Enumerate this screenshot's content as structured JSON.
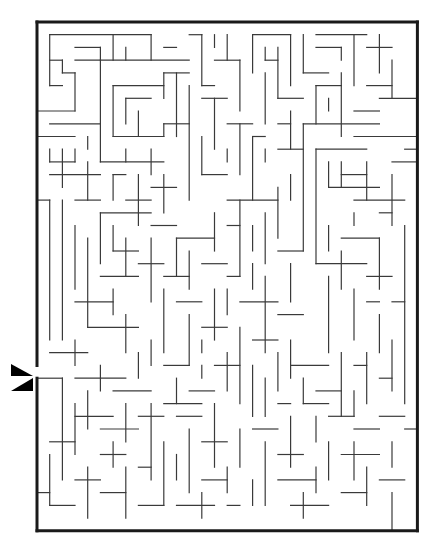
{
  "puzzle": {
    "type": "maze",
    "title": "",
    "grid": {
      "origin_x": 37,
      "origin_y": 22,
      "cols": 30,
      "rows": 40,
      "cell_w": 12.68,
      "cell_h": 12.72
    },
    "colors": {
      "wall": "#3a3a3a",
      "border": "#1a1a1a",
      "background": "#ffffff",
      "marker": "#000000"
    },
    "entrance": {
      "side": "left",
      "row": 27,
      "markers": [
        {
          "name": "arrow-in-icon",
          "direction": "right",
          "points": "11,364 33,376 11,376"
        },
        {
          "name": "arrow-out-icon",
          "direction": "left",
          "points": "33,378 33,391 11,391"
        }
      ]
    },
    "border_segments": [
      [
        0,
        0,
        30,
        0
      ],
      [
        30,
        0,
        30,
        40
      ],
      [
        0,
        40,
        30,
        40
      ],
      [
        0,
        0,
        0,
        27
      ],
      [
        0,
        28,
        0,
        40
      ]
    ],
    "walls": [
      [
        1,
        1,
        9,
        1
      ],
      [
        1,
        1,
        1,
        5
      ],
      [
        3,
        2,
        5,
        2
      ],
      [
        5,
        2,
        5,
        3
      ],
      [
        3,
        3,
        12,
        3
      ],
      [
        6,
        1,
        6,
        3
      ],
      [
        7,
        2,
        7,
        3
      ],
      [
        9,
        1,
        9,
        3
      ],
      [
        10,
        2,
        11,
        2
      ],
      [
        1,
        3,
        2,
        3
      ],
      [
        2,
        3,
        2,
        4
      ],
      [
        2,
        4,
        3,
        4
      ],
      [
        3,
        4,
        3,
        7
      ],
      [
        1,
        5,
        2,
        5
      ],
      [
        0,
        7,
        3,
        7
      ],
      [
        5,
        3,
        5,
        11
      ],
      [
        6,
        5,
        10,
        5
      ],
      [
        6,
        5,
        6,
        9
      ],
      [
        6,
        9,
        10,
        9
      ],
      [
        7,
        6,
        9,
        6
      ],
      [
        7,
        6,
        7,
        8
      ],
      [
        8,
        7,
        8,
        9
      ],
      [
        10,
        4,
        12,
        4
      ],
      [
        10,
        4,
        10,
        6
      ],
      [
        10,
        8,
        12,
        8
      ],
      [
        10,
        8,
        10,
        9
      ],
      [
        1,
        8,
        5,
        8
      ],
      [
        0,
        9,
        3,
        9
      ],
      [
        1,
        10,
        1,
        11
      ],
      [
        1,
        11,
        3,
        11
      ],
      [
        3,
        10,
        3,
        11
      ],
      [
        4,
        9,
        4,
        10
      ],
      [
        2,
        10,
        2,
        13
      ],
      [
        1,
        12,
        5,
        12
      ],
      [
        4,
        11,
        4,
        14
      ],
      [
        5,
        11,
        10,
        11
      ],
      [
        7,
        10,
        7,
        11
      ],
      [
        9,
        10,
        9,
        12
      ],
      [
        3,
        14,
        5,
        14
      ],
      [
        1,
        14,
        1,
        25
      ],
      [
        2,
        14,
        2,
        25
      ],
      [
        0,
        14,
        1,
        14
      ],
      [
        6,
        12,
        6,
        14
      ],
      [
        6,
        12,
        7,
        12
      ],
      [
        7,
        14,
        9,
        14
      ],
      [
        8,
        12,
        8,
        16
      ],
      [
        9,
        16,
        11,
        16
      ],
      [
        9,
        13,
        11,
        13
      ],
      [
        10,
        12,
        10,
        15
      ],
      [
        12,
        1,
        13,
        1
      ],
      [
        13,
        1,
        13,
        5
      ],
      [
        14,
        1,
        14,
        2
      ],
      [
        15,
        1,
        15,
        3
      ],
      [
        13,
        5,
        14,
        5
      ],
      [
        14,
        3,
        16,
        3
      ],
      [
        16,
        3,
        16,
        7
      ],
      [
        17,
        1,
        20,
        1
      ],
      [
        17,
        1,
        17,
        4
      ],
      [
        18,
        2,
        18,
        3
      ],
      [
        18,
        3,
        19,
        3
      ],
      [
        19,
        2,
        19,
        6
      ],
      [
        20,
        1,
        20,
        5
      ],
      [
        19,
        6,
        21,
        6
      ],
      [
        12,
        5,
        12,
        14
      ],
      [
        11,
        4,
        11,
        9
      ],
      [
        13,
        6,
        15,
        6
      ],
      [
        14,
        6,
        14,
        10
      ],
      [
        15,
        8,
        17,
        8
      ],
      [
        16,
        8,
        16,
        12
      ],
      [
        13,
        9,
        13,
        12
      ],
      [
        13,
        12,
        15,
        12
      ],
      [
        15,
        10,
        15,
        11
      ],
      [
        17,
        9,
        18,
        9
      ],
      [
        17,
        9,
        17,
        14
      ],
      [
        18,
        10,
        18,
        11
      ],
      [
        21,
        1,
        21,
        4
      ],
      [
        21,
        4,
        23,
        4
      ],
      [
        22,
        1,
        26,
        1
      ],
      [
        22,
        2,
        24,
        2
      ],
      [
        24,
        2,
        24,
        3
      ],
      [
        25,
        1,
        25,
        5
      ],
      [
        26,
        2,
        28,
        2
      ],
      [
        27,
        1,
        27,
        4
      ],
      [
        28,
        3,
        28,
        6
      ],
      [
        26,
        5,
        28,
        5
      ],
      [
        24,
        4,
        24,
        9
      ],
      [
        22,
        5,
        24,
        5
      ],
      [
        22,
        5,
        22,
        8
      ],
      [
        23,
        6,
        23,
        7
      ],
      [
        21,
        8,
        27,
        8
      ],
      [
        27,
        6,
        30,
        6
      ],
      [
        25,
        7,
        27,
        7
      ],
      [
        25,
        9,
        30,
        9
      ],
      [
        21,
        8,
        21,
        18
      ],
      [
        18,
        4,
        18,
        8
      ],
      [
        19,
        8,
        20,
        8
      ],
      [
        20,
        7,
        20,
        10
      ],
      [
        19,
        10,
        21,
        10
      ],
      [
        22,
        10,
        26,
        10
      ],
      [
        22,
        10,
        22,
        19
      ],
      [
        23,
        11,
        23,
        13
      ],
      [
        23,
        13,
        27,
        13
      ],
      [
        24,
        12,
        26,
        12
      ],
      [
        24,
        11,
        24,
        13
      ],
      [
        25,
        14,
        29,
        14
      ],
      [
        26,
        11,
        26,
        14
      ],
      [
        28,
        12,
        28,
        16
      ],
      [
        27,
        15,
        28,
        15
      ],
      [
        29,
        10,
        30,
        10
      ],
      [
        28,
        11,
        30,
        11
      ],
      [
        22,
        19,
        26,
        19
      ],
      [
        23,
        16,
        23,
        18
      ],
      [
        24,
        17,
        27,
        17
      ],
      [
        25,
        15,
        25,
        16
      ],
      [
        27,
        17,
        27,
        21
      ],
      [
        24,
        18,
        24,
        21
      ],
      [
        26,
        20,
        28,
        20
      ],
      [
        29,
        16,
        29,
        30
      ],
      [
        28,
        22,
        29,
        22
      ],
      [
        25,
        21,
        25,
        25
      ],
      [
        23,
        20,
        23,
        26
      ],
      [
        11,
        17,
        14,
        17
      ],
      [
        11,
        17,
        11,
        20
      ],
      [
        12,
        18,
        12,
        21
      ],
      [
        13,
        19,
        15,
        19
      ],
      [
        14,
        15,
        14,
        18
      ],
      [
        15,
        16,
        16,
        16
      ],
      [
        16,
        14,
        16,
        20
      ],
      [
        15,
        14,
        19,
        14
      ],
      [
        18,
        15,
        18,
        19
      ],
      [
        19,
        13,
        19,
        17
      ],
      [
        20,
        12,
        20,
        14
      ],
      [
        17,
        16,
        17,
        18
      ],
      [
        5,
        15,
        9,
        15
      ],
      [
        5,
        15,
        5,
        19
      ],
      [
        6,
        16,
        6,
        18
      ],
      [
        6,
        18,
        8,
        18
      ],
      [
        7,
        17,
        7,
        20
      ],
      [
        8,
        19,
        10,
        19
      ],
      [
        9,
        17,
        9,
        22
      ],
      [
        3,
        16,
        3,
        21
      ],
      [
        4,
        17,
        4,
        24
      ],
      [
        3,
        22,
        6,
        22
      ],
      [
        5,
        20,
        8,
        20
      ],
      [
        6,
        21,
        6,
        23
      ],
      [
        4,
        24,
        8,
        24
      ],
      [
        7,
        23,
        7,
        26
      ],
      [
        10,
        20,
        12,
        20
      ],
      [
        10,
        21,
        10,
        26
      ],
      [
        11,
        22,
        13,
        22
      ],
      [
        12,
        23,
        12,
        27
      ],
      [
        13,
        24,
        15,
        24
      ],
      [
        14,
        21,
        14,
        25
      ],
      [
        15,
        20,
        16,
        20
      ],
      [
        15,
        21,
        15,
        23
      ],
      [
        16,
        22,
        19,
        22
      ],
      [
        17,
        19,
        17,
        21
      ],
      [
        18,
        20,
        18,
        26
      ],
      [
        19,
        23,
        21,
        23
      ],
      [
        20,
        19,
        20,
        22
      ],
      [
        19,
        18,
        21,
        18
      ],
      [
        16,
        24,
        16,
        30
      ],
      [
        17,
        25,
        19,
        25
      ],
      [
        17,
        27,
        17,
        31
      ],
      [
        19,
        26,
        19,
        29
      ],
      [
        1,
        26,
        4,
        26
      ],
      [
        3,
        25,
        3,
        27
      ],
      [
        0,
        28,
        2,
        28
      ],
      [
        2,
        28,
        2,
        36
      ],
      [
        3,
        28,
        7,
        28
      ],
      [
        5,
        27,
        5,
        29
      ],
      [
        6,
        29,
        9,
        29
      ],
      [
        8,
        26,
        8,
        28
      ],
      [
        9,
        25,
        9,
        27
      ],
      [
        10,
        27,
        12,
        27
      ],
      [
        11,
        28,
        11,
        30
      ],
      [
        12,
        29,
        14,
        29
      ],
      [
        13,
        27,
        13,
        28
      ],
      [
        3,
        30,
        3,
        34
      ],
      [
        4,
        29,
        4,
        32
      ],
      [
        3,
        31,
        6,
        31
      ],
      [
        5,
        32,
        8,
        32
      ],
      [
        7,
        30,
        7,
        33
      ],
      [
        8,
        31,
        10,
        31
      ],
      [
        9,
        30,
        9,
        36
      ],
      [
        1,
        33,
        3,
        33
      ],
      [
        1,
        34,
        1,
        38
      ],
      [
        0,
        37,
        1,
        37
      ],
      [
        1,
        38,
        3,
        38
      ],
      [
        3,
        36,
        5,
        36
      ],
      [
        4,
        35,
        4,
        39
      ],
      [
        5,
        37,
        7,
        37
      ],
      [
        6,
        33,
        6,
        35
      ],
      [
        5,
        34,
        7,
        34
      ],
      [
        7,
        35,
        7,
        39
      ],
      [
        8,
        38,
        10,
        38
      ],
      [
        10,
        33,
        10,
        38
      ],
      [
        8,
        35,
        9,
        35
      ],
      [
        11,
        31,
        13,
        31
      ],
      [
        12,
        32,
        12,
        37
      ],
      [
        13,
        33,
        15,
        33
      ],
      [
        14,
        30,
        14,
        35
      ],
      [
        11,
        34,
        11,
        36
      ],
      [
        13,
        36,
        15,
        36
      ],
      [
        15,
        35,
        15,
        37
      ],
      [
        11,
        38,
        14,
        38
      ],
      [
        13,
        37,
        13,
        39
      ],
      [
        15,
        38,
        16,
        38
      ],
      [
        16,
        32,
        16,
        35
      ],
      [
        17,
        32,
        19,
        32
      ],
      [
        18,
        33,
        18,
        38
      ],
      [
        19,
        34,
        21,
        34
      ],
      [
        20,
        31,
        20,
        35
      ],
      [
        17,
        36,
        17,
        38
      ],
      [
        19,
        36,
        22,
        36
      ],
      [
        21,
        37,
        21,
        39
      ],
      [
        20,
        38,
        23,
        38
      ],
      [
        22,
        35,
        22,
        37
      ],
      [
        23,
        33,
        23,
        36
      ],
      [
        24,
        37,
        26,
        37
      ],
      [
        24,
        34,
        27,
        34
      ],
      [
        25,
        33,
        25,
        36
      ],
      [
        26,
        35,
        26,
        38
      ],
      [
        27,
        36,
        29,
        36
      ],
      [
        28,
        33,
        28,
        35
      ],
      [
        27,
        31,
        29,
        31
      ],
      [
        28,
        37,
        28,
        40
      ],
      [
        29,
        32,
        30,
        32
      ],
      [
        20,
        27,
        23,
        27
      ],
      [
        20,
        25,
        20,
        28
      ],
      [
        21,
        28,
        21,
        30
      ],
      [
        22,
        29,
        24,
        29
      ],
      [
        24,
        26,
        24,
        31
      ],
      [
        25,
        27,
        26,
        27
      ],
      [
        26,
        26,
        26,
        30
      ],
      [
        25,
        29,
        25,
        31
      ],
      [
        27,
        28,
        28,
        28
      ],
      [
        28,
        25,
        28,
        29
      ],
      [
        26,
        22,
        27,
        22
      ],
      [
        27,
        23,
        27,
        26
      ],
      [
        21,
        30,
        23,
        30
      ],
      [
        22,
        31,
        22,
        33
      ],
      [
        23,
        31,
        25,
        31
      ],
      [
        25,
        32,
        27,
        32
      ],
      [
        19,
        30,
        20,
        30
      ],
      [
        18,
        28,
        18,
        31
      ],
      [
        15,
        26,
        15,
        29
      ],
      [
        14,
        27,
        16,
        27
      ],
      [
        13,
        25,
        13,
        26
      ],
      [
        10,
        30,
        13,
        30
      ]
    ]
  }
}
